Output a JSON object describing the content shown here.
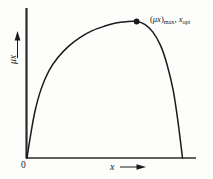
{
  "figure": {
    "background_color": "#fdfdfc",
    "line_color": "#1a1a1a",
    "axis_color": "#2b2b2b"
  },
  "axes": {
    "y_label": "μx",
    "x_label": "x",
    "origin_label": "0",
    "y_arrow_direction": "up",
    "x_arrow_direction": "right"
  },
  "annotation": {
    "peak_prefix": "(",
    "peak_symbol": "μx",
    "peak_close": ")",
    "peak_subscript": "max",
    "separator": ", ",
    "second_symbol": "x",
    "second_subscript": "opt",
    "full_text": "(μx)max, xopt"
  },
  "chart_data": {
    "type": "line",
    "title": "",
    "xlabel": "x",
    "ylabel": "μx",
    "xlim": [
      0,
      1
    ],
    "ylim": [
      0,
      1
    ],
    "grid": false,
    "legend": "none",
    "annotations": [
      {
        "text": "(μx)max, xopt",
        "x": 0.705,
        "y": 0.895,
        "marker": "filled-circle"
      }
    ],
    "series": [
      {
        "name": "specific growth rate curve",
        "x": [
          0.0,
          0.02,
          0.05,
          0.09,
          0.14,
          0.2,
          0.27,
          0.34,
          0.42,
          0.5,
          0.57,
          0.64,
          0.705,
          0.76,
          0.81,
          0.86,
          0.9,
          0.94,
          0.97,
          1.0
        ],
        "y": [
          0.0,
          0.13,
          0.3,
          0.45,
          0.57,
          0.66,
          0.735,
          0.79,
          0.835,
          0.865,
          0.885,
          0.894,
          0.895,
          0.875,
          0.825,
          0.735,
          0.615,
          0.445,
          0.245,
          0.0
        ]
      }
    ]
  }
}
